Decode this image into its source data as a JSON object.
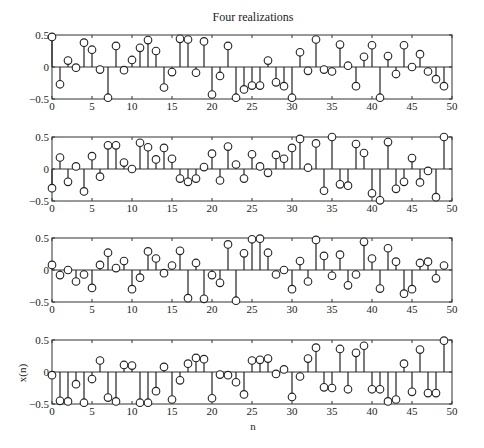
{
  "figure": {
    "title": "Four realizations",
    "xlabel": "n",
    "ylabel": "x(n)"
  },
  "chart_data": [
    {
      "type": "stem",
      "title": "Four realizations",
      "xlabel": "",
      "ylabel": "",
      "xlim": [
        0,
        50
      ],
      "ylim": [
        -0.5,
        0.5
      ],
      "xticks": [
        "0",
        "5",
        "10",
        "15",
        "20",
        "25",
        "30",
        "35",
        "40",
        "45",
        "50"
      ],
      "yticks": [
        "0.5",
        "0",
        "−0.5"
      ],
      "x": [
        0,
        1,
        2,
        3,
        4,
        5,
        6,
        7,
        8,
        9,
        10,
        11,
        12,
        13,
        14,
        15,
        16,
        17,
        18,
        19,
        20,
        21,
        22,
        23,
        24,
        25,
        26,
        27,
        28,
        29,
        30,
        31,
        32,
        33,
        34,
        35,
        36,
        37,
        38,
        39,
        40,
        41,
        42,
        43,
        44,
        45,
        46,
        47,
        48,
        49
      ],
      "values": [
        0.47,
        -0.27,
        0.1,
        -0.01,
        0.38,
        0.27,
        -0.04,
        -0.48,
        0.33,
        -0.05,
        0.11,
        0.3,
        0.42,
        0.25,
        -0.32,
        -0.08,
        0.44,
        0.43,
        -0.09,
        0.4,
        -0.43,
        -0.14,
        0.33,
        -0.48,
        -0.35,
        -0.29,
        -0.29,
        0.1,
        -0.24,
        -0.3,
        -0.48,
        0.23,
        -0.06,
        0.43,
        -0.04,
        -0.07,
        0.35,
        0.02,
        -0.3,
        0.16,
        0.34,
        -0.48,
        0.17,
        -0.11,
        0.34,
        0.0,
        0.2,
        -0.07,
        -0.19,
        -0.3
      ],
      "grid": false
    },
    {
      "type": "stem",
      "title": "",
      "xlabel": "",
      "ylabel": "",
      "xlim": [
        0,
        50
      ],
      "ylim": [
        -0.5,
        0.5
      ],
      "xticks": [
        "0",
        "5",
        "10",
        "15",
        "20",
        "25",
        "30",
        "35",
        "40",
        "45",
        "50"
      ],
      "yticks": [
        "0.5",
        "0",
        "−0.5"
      ],
      "x": [
        0,
        1,
        2,
        3,
        4,
        5,
        6,
        7,
        8,
        9,
        10,
        11,
        12,
        13,
        14,
        15,
        16,
        17,
        18,
        19,
        20,
        21,
        22,
        23,
        24,
        25,
        26,
        27,
        28,
        29,
        30,
        31,
        32,
        33,
        34,
        35,
        36,
        37,
        38,
        39,
        40,
        41,
        42,
        43,
        44,
        45,
        46,
        47,
        48,
        49
      ],
      "values": [
        -0.3,
        0.18,
        -0.2,
        0.04,
        -0.35,
        0.2,
        -0.12,
        0.37,
        0.37,
        0.1,
        0.0,
        0.41,
        0.34,
        0.15,
        0.33,
        0.16,
        -0.15,
        -0.2,
        -0.15,
        0.03,
        0.24,
        -0.18,
        0.35,
        0.07,
        -0.15,
        0.23,
        0.04,
        -0.06,
        0.22,
        0.16,
        0.33,
        0.47,
        0.02,
        0.4,
        -0.34,
        0.5,
        -0.24,
        -0.26,
        0.39,
        0.25,
        -0.38,
        -0.49,
        0.42,
        -0.31,
        -0.2,
        0.17,
        -0.21,
        -0.03,
        -0.44,
        0.5
      ],
      "grid": false
    },
    {
      "type": "stem",
      "title": "",
      "xlabel": "",
      "ylabel": "",
      "xlim": [
        0,
        50
      ],
      "ylim": [
        -0.5,
        0.5
      ],
      "xticks": [
        "0",
        "5",
        "10",
        "15",
        "20",
        "25",
        "30",
        "35",
        "40",
        "45",
        "50"
      ],
      "yticks": [
        "0.5",
        "0",
        "−0.5"
      ],
      "x": [
        0,
        1,
        2,
        3,
        4,
        5,
        6,
        7,
        8,
        9,
        10,
        11,
        12,
        13,
        14,
        15,
        16,
        17,
        18,
        19,
        20,
        21,
        22,
        23,
        24,
        25,
        26,
        27,
        28,
        29,
        30,
        31,
        32,
        33,
        34,
        35,
        36,
        37,
        38,
        39,
        40,
        41,
        42,
        43,
        44,
        45,
        46,
        47,
        48,
        49
      ],
      "values": [
        0.08,
        -0.08,
        0.0,
        -0.18,
        -0.07,
        -0.28,
        0.08,
        0.27,
        0.03,
        0.14,
        -0.3,
        -0.12,
        0.29,
        0.18,
        -0.05,
        0.07,
        0.3,
        -0.44,
        0.11,
        -0.45,
        -0.08,
        -0.2,
        0.4,
        -0.48,
        0.26,
        0.48,
        0.49,
        0.27,
        -0.07,
        0.0,
        -0.3,
        0.14,
        -0.18,
        0.47,
        0.22,
        -0.09,
        0.24,
        -0.24,
        -0.07,
        0.44,
        0.18,
        -0.29,
        0.34,
        0.13,
        -0.37,
        -0.3,
        0.11,
        0.13,
        -0.13,
        0.07
      ],
      "grid": false
    },
    {
      "type": "stem",
      "title": "",
      "xlabel": "n",
      "ylabel": "x(n)",
      "xlim": [
        0,
        50
      ],
      "ylim": [
        -0.5,
        0.5
      ],
      "xticks": [
        "0",
        "5",
        "10",
        "15",
        "20",
        "25",
        "30",
        "35",
        "40",
        "45",
        "50"
      ],
      "yticks": [
        "0.5",
        "0",
        "−0.5"
      ],
      "x": [
        0,
        1,
        2,
        3,
        4,
        5,
        6,
        7,
        8,
        9,
        10,
        11,
        12,
        13,
        14,
        15,
        16,
        17,
        18,
        19,
        20,
        21,
        22,
        23,
        24,
        25,
        26,
        27,
        28,
        29,
        30,
        31,
        32,
        33,
        34,
        35,
        36,
        37,
        38,
        39,
        40,
        41,
        42,
        43,
        44,
        45,
        46,
        47,
        48,
        49
      ],
      "values": [
        -0.05,
        -0.45,
        -0.46,
        -0.19,
        -0.48,
        -0.11,
        0.18,
        -0.4,
        -0.46,
        0.11,
        0.1,
        -0.48,
        -0.48,
        -0.3,
        0.08,
        -0.43,
        -0.13,
        0.13,
        0.22,
        0.2,
        -0.41,
        -0.04,
        -0.05,
        -0.16,
        -0.35,
        0.18,
        0.19,
        0.21,
        -0.03,
        0.04,
        -0.39,
        -0.07,
        0.21,
        0.38,
        -0.24,
        -0.25,
        0.36,
        -0.27,
        0.3,
        0.41,
        -0.27,
        -0.27,
        -0.46,
        -0.43,
        0.13,
        -0.31,
        0.35,
        -0.33,
        -0.33,
        0.49
      ],
      "grid": false
    }
  ]
}
